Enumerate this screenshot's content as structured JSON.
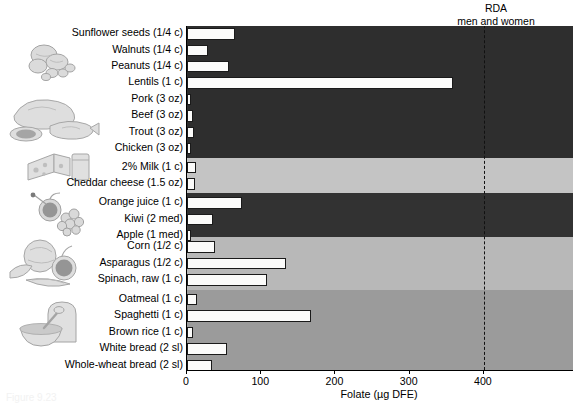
{
  "rda_header": {
    "line1": "RDA",
    "line2": "men and women"
  },
  "axis": {
    "title": "Folate (µg DFE)",
    "ticks": [
      "0",
      "100",
      "200",
      "300",
      "400"
    ],
    "tick_values": [
      0,
      100,
      200,
      300,
      400
    ],
    "xmin": 0,
    "xmax": 520
  },
  "rda_value": 400,
  "caption": "Figure 9.23",
  "chart_data": {
    "type": "bar",
    "title": "",
    "subtitle": "",
    "orientation": "horizontal",
    "xlabel": "Folate (µg DFE)",
    "ylabel": "",
    "xlim": [
      0,
      520
    ],
    "grid": false,
    "legend": false,
    "annotations": [
      {
        "label": "RDA men and women",
        "x": 400,
        "style": "dashed-vertical-line"
      }
    ],
    "categories": [
      "Sunflower seeds (1/4 c)",
      "Walnuts (1/4 c)",
      "Peanuts (1/4 c)",
      "Lentils (1 c)",
      "Pork (3 oz)",
      "Beef (3 oz)",
      "Trout (3 oz)",
      "Chicken (3 oz)",
      "2% Milk (1 c)",
      "Cheddar cheese (1.5 oz)",
      "Orange juice (1 c)",
      "Kiwi (2 med)",
      "Apple (1 med)",
      "Corn (1/2 c)",
      "Asparagus (1/2 c)",
      "Spinach, raw (1 c)",
      "Oatmeal (1 c)",
      "Spaghetti (1 c)",
      "Brown rice (1 c)",
      "White bread (2 sl)",
      "Whole-wheat bread (2 sl)"
    ],
    "values": [
      64,
      28,
      56,
      358,
      5,
      8,
      9,
      6,
      12,
      11,
      74,
      35,
      5,
      38,
      134,
      108,
      13,
      167,
      8,
      54,
      34
    ],
    "groups": [
      {
        "name": "Nuts, seeds, and legumes",
        "start": 0,
        "end": 3,
        "band_color": "#2f2f2f"
      },
      {
        "name": "Meats and protein foods",
        "start": 4,
        "end": 7,
        "band_color": "#2f2f2f"
      },
      {
        "name": "Dairy",
        "start": 8,
        "end": 9,
        "band_color": "#c3c3c3"
      },
      {
        "name": "Fruits",
        "start": 10,
        "end": 12,
        "band_color": "#333333"
      },
      {
        "name": "Vegetables",
        "start": 13,
        "end": 15,
        "band_color": "#b7b7b7"
      },
      {
        "name": "Grains",
        "start": 16,
        "end": 20,
        "band_color": "#9a9a9a"
      }
    ]
  },
  "bands": [
    {
      "name": "nuts-seeds-legumes-and-protein-band",
      "top": 0,
      "height": 132,
      "color": "#2e2e2e"
    },
    {
      "name": "dairy-band",
      "top": 132,
      "height": 35,
      "color": "#c4c4c4"
    },
    {
      "name": "fruits-band",
      "top": 167,
      "height": 44,
      "color": "#323232"
    },
    {
      "name": "vegetables-band",
      "top": 211,
      "height": 53,
      "color": "#b8b8b8"
    },
    {
      "name": "grains-band",
      "top": 264,
      "height": 80,
      "color": "#9b9b9b"
    }
  ],
  "bar_color": "#fbfbfa",
  "bar_outline_color": "#1a1a1a",
  "illustrations": [
    {
      "name": "nuts-and-seeds-illustration",
      "label": "nuts and seeds"
    },
    {
      "name": "meat-and-fish-illustration",
      "label": "meat, poultry and fish"
    },
    {
      "name": "cheese-and-milk-illustration",
      "label": "cheese and milk"
    },
    {
      "name": "fruit-illustration",
      "label": "apple, cherries and grapes"
    },
    {
      "name": "vegetables-illustration",
      "label": "cabbage, tomato and carrot"
    },
    {
      "name": "bread-and-cereal-illustration",
      "label": "bread and bowl of cereal"
    }
  ]
}
